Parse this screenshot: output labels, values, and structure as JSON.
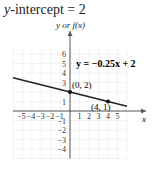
{
  "header": {
    "title_var": "y",
    "title_rest": "-intercept = 2"
  },
  "axes": {
    "y_label": "y or f(x)",
    "x_label": "x"
  },
  "equation": "y = −0.25x + 2",
  "points": [
    {
      "label": "(0, 2)",
      "x": 0,
      "y": 2
    },
    {
      "label": "(4, 1)",
      "x": 4,
      "y": 1
    }
  ],
  "chart_data": {
    "type": "line",
    "title": "y-intercept = 2",
    "xlabel": "x",
    "ylabel": "y or f(x)",
    "x_ticks": [
      -5,
      -4,
      -3,
      -2,
      -1,
      1,
      2,
      3,
      4,
      5
    ],
    "y_ticks": [
      -4,
      -3,
      -2,
      -1,
      1,
      2,
      3,
      4,
      5,
      6
    ],
    "series": [
      {
        "name": "y = −0.25x + 2",
        "slope": -0.25,
        "intercept": 2,
        "x": [
          -6,
          6
        ],
        "y": [
          3.5,
          0.5
        ]
      }
    ],
    "points": [
      [
        0,
        2
      ],
      [
        4,
        1
      ]
    ],
    "xlim": [
      -6,
      6
    ],
    "ylim": [
      -5,
      7
    ],
    "grid": true
  }
}
